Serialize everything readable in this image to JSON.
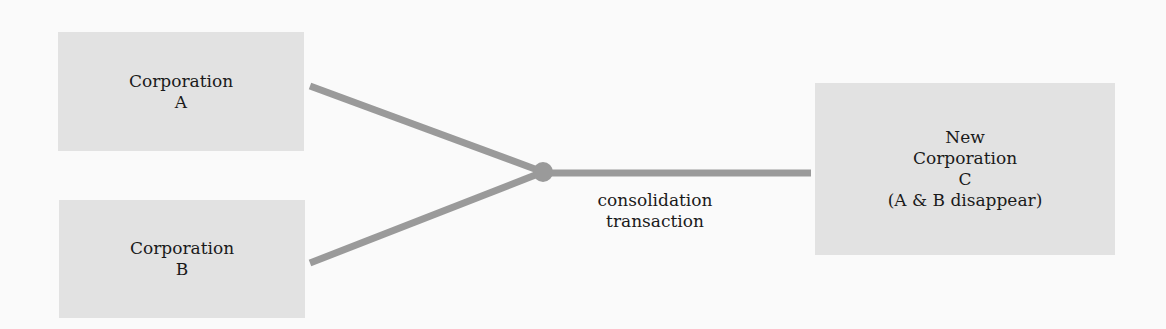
{
  "diagram": {
    "nodes": [
      {
        "id": "A",
        "lines": [
          "Corporation",
          "A"
        ]
      },
      {
        "id": "B",
        "lines": [
          "Corporation",
          "B"
        ]
      },
      {
        "id": "C",
        "lines": [
          "New",
          "Corporation",
          "C",
          "(A & B disappear)"
        ]
      }
    ],
    "edge_label": {
      "lines": [
        "consolidation",
        "transaction"
      ]
    },
    "edges": [
      {
        "from": "A",
        "to": "junction"
      },
      {
        "from": "B",
        "to": "junction"
      },
      {
        "from": "junction",
        "to": "C"
      }
    ],
    "colors": {
      "box_fill": "#e2e2e2",
      "connector": "#9a9a9a",
      "background": "#fafafa"
    }
  }
}
